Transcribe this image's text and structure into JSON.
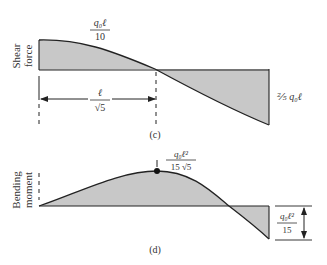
{
  "figure": {
    "panel_c": {
      "caption": "(c)",
      "axis_label_line1": "Shear",
      "axis_label_line2": "force",
      "max_label_num": "q₀ℓ",
      "max_label_den": "10",
      "min_label": "⅖ q₀ℓ",
      "dimension_num": "ℓ",
      "dimension_den": "√5"
    },
    "panel_d": {
      "caption": "(d)",
      "axis_label_line1": "Bending",
      "axis_label_line2": "moment",
      "peak_label_num": "q₀ℓ²",
      "peak_label_den": "15 √5",
      "end_label_num": "q₀ℓ²",
      "end_label_den": "15"
    },
    "colors": {
      "fill": "#c8c8c8",
      "stroke": "#222222"
    }
  }
}
